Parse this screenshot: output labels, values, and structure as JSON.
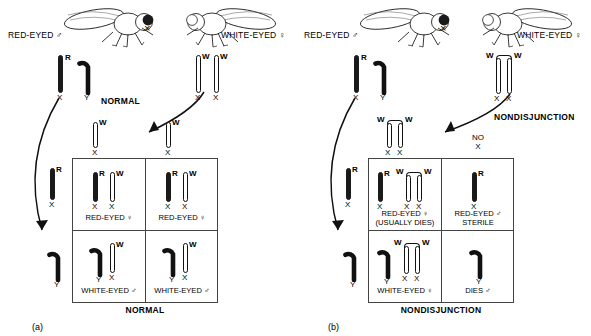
{
  "figure": {
    "caption_a": "(a)",
    "caption_b": "(b)",
    "cross_symbol": "×"
  },
  "panel_a": {
    "process": "NORMAL",
    "bottom_label": "NORMAL",
    "father": {
      "fly_label": "RED-EYED ♂",
      "chromosomes": [
        {
          "allele": "R",
          "base": "X",
          "type": "rod-filled"
        },
        {
          "allele": "",
          "base": "Y",
          "type": "hook"
        }
      ]
    },
    "mother": {
      "fly_label": "WHITE-EYED ♀",
      "chromosomes": [
        {
          "allele": "W",
          "base": "X",
          "type": "rod-open"
        },
        {
          "allele": "W",
          "base": "X",
          "type": "rod-open"
        }
      ],
      "attached": false
    },
    "egg_gametes": [
      {
        "allele": "W",
        "base": "X",
        "type": "rod-open"
      },
      {
        "allele": "W",
        "base": "X",
        "type": "rod-open"
      }
    ],
    "sperm_gametes": [
      {
        "allele": "R",
        "base": "X",
        "type": "rod-filled"
      },
      {
        "allele": "",
        "base": "Y",
        "type": "hook"
      }
    ],
    "offspring": [
      {
        "line1": "RED-EYED ♀",
        "line2": "",
        "genotype": "X(R) X(W)"
      },
      {
        "line1": "RED-EYED ♀",
        "line2": "",
        "genotype": "X(R) X(W)"
      },
      {
        "line1": "WHITE-EYED ♂",
        "line2": "",
        "genotype": "Y X(W)"
      },
      {
        "line1": "WHITE-EYED ♂",
        "line2": "",
        "genotype": "Y X(W)"
      }
    ]
  },
  "panel_b": {
    "process": "NONDISJUNCTION",
    "bottom_label": "NONDISJUNCTION",
    "father": {
      "fly_label": "RED-EYED ♂",
      "chromosomes": [
        {
          "allele": "R",
          "base": "X",
          "type": "rod-filled"
        },
        {
          "allele": "",
          "base": "Y",
          "type": "hook"
        }
      ]
    },
    "mother": {
      "fly_label": "WHITE-EYED ♀",
      "chromosomes": [
        {
          "allele": "W",
          "base": "X",
          "type": "rod-open"
        },
        {
          "allele": "W",
          "base": "X",
          "type": "rod-open"
        }
      ],
      "attached": true
    },
    "egg_gametes": [
      {
        "allele": "W W",
        "base": "X X",
        "type": "attached-pair"
      },
      {
        "allele": "",
        "base": "NO X",
        "type": "none"
      }
    ],
    "sperm_gametes": [
      {
        "allele": "R",
        "base": "X",
        "type": "rod-filled"
      },
      {
        "allele": "",
        "base": "Y",
        "type": "hook"
      }
    ],
    "no_x_text_line1": "NO",
    "no_x_text_line2": "X",
    "offspring": [
      {
        "line1": "RED-EYED ♀",
        "line2": "(USUALLY DIES)",
        "genotype": "X(R) X(W) X(W)"
      },
      {
        "line1": "RED-EYED ♂",
        "line2": "STERILE",
        "genotype": "X(R)"
      },
      {
        "line1": "WHITE-EYED ♀",
        "line2": "",
        "genotype": "Y X(W) X(W)"
      },
      {
        "line1": "DIES ♂",
        "line2": "",
        "genotype": "Y"
      }
    ]
  }
}
